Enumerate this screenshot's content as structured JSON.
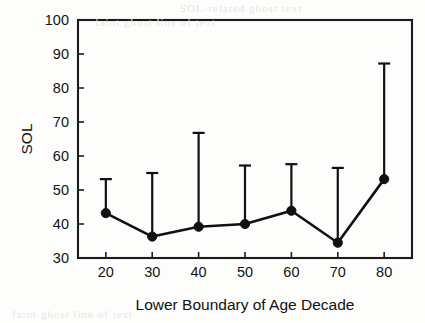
{
  "figure": {
    "background_color": "#fdfdfc",
    "ink_color": "#111111"
  },
  "scan_artifacts": {
    "note": "faint bleed-through text from reverse of printed page, illegible",
    "top_line_1": "SOL-related ghost text",
    "top_line_2": "faint ghost line of text",
    "bottom_line": "faint ghost line of text"
  },
  "chart_data": {
    "type": "line",
    "title": "",
    "xlabel": "Lower Boundary of Age Decade",
    "ylabel": "SOL",
    "xlim": [
      14,
      86
    ],
    "ylim": [
      30,
      100
    ],
    "xticks": [
      20,
      30,
      40,
      50,
      60,
      70,
      80
    ],
    "yticks": [
      30,
      40,
      50,
      60,
      70,
      80,
      90,
      100
    ],
    "xticklabels": [
      "20",
      "30",
      "40",
      "50",
      "60",
      "70",
      "80"
    ],
    "yticklabels": [
      "30",
      "40",
      "50",
      "60",
      "70",
      "80",
      "90",
      "100"
    ],
    "grid": false,
    "legend": false,
    "marker": "filled-circle",
    "error_bars": "upper-only",
    "categories": [
      20,
      30,
      40,
      50,
      60,
      70,
      80
    ],
    "values": [
      43.2,
      36.3,
      39.2,
      40.0,
      43.9,
      34.5,
      53.2
    ],
    "error_upper": [
      53.2,
      55.0,
      66.8,
      57.2,
      57.6,
      56.5,
      87.2
    ],
    "series": [
      {
        "name": "SOL",
        "x": [
          20,
          30,
          40,
          50,
          60,
          70,
          80
        ],
        "values": [
          43.2,
          36.3,
          39.2,
          40.0,
          43.9,
          34.5,
          53.2
        ],
        "error_upper": [
          53.2,
          55.0,
          66.8,
          57.2,
          57.6,
          56.5,
          87.2
        ]
      }
    ]
  }
}
